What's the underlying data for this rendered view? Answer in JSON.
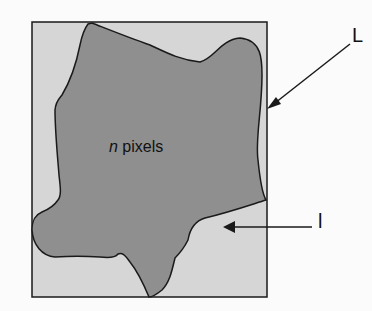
{
  "diagram": {
    "colors": {
      "background": "#fbfbfb",
      "frame_fill": "#d6d6d6",
      "blob_fill": "#8f8f8f",
      "stroke": "#1a1a1a"
    },
    "region_label": {
      "italic_part": "n",
      "rest": " pixels"
    },
    "label_L": "L",
    "label_l": "l"
  }
}
